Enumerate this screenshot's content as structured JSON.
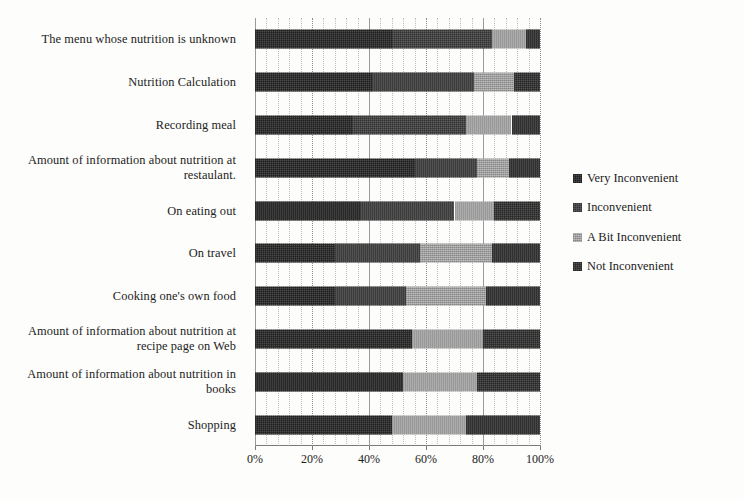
{
  "chart_data": {
    "type": "bar",
    "orientation": "horizontal",
    "stacked": true,
    "normalized": "100%",
    "title": "",
    "xlabel": "",
    "ylabel": "",
    "xlim": [
      0,
      100
    ],
    "xticks": [
      "0%",
      "20%",
      "40%",
      "60%",
      "80%",
      "100%"
    ],
    "xtick_values": [
      0,
      20,
      40,
      60,
      80,
      100
    ],
    "grid": "vertical-dotted",
    "legend_position": "right",
    "categories": [
      "The menu whose nutrition is unknown",
      "Nutrition Calculation",
      "Recording meal",
      "Amount of information about nutrition at restaulant.",
      "On eating out",
      "On travel",
      "Cooking one's own food",
      "Amount of information about nutrition at recipe page on Web",
      "Amount of information about nutrition in books",
      "Shopping"
    ],
    "series": [
      {
        "name": "Very Inconvenient",
        "color": "#4a4a4a",
        "values": [
          48,
          41,
          34,
          56,
          37,
          28,
          28,
          55,
          52,
          48
        ]
      },
      {
        "name": "Inconvenient",
        "color": "#5e5e5e",
        "values": [
          35,
          36,
          40,
          22,
          33,
          30,
          25,
          0,
          0,
          0
        ]
      },
      {
        "name": "A Bit Inconvenient",
        "color": "#9d9d9d",
        "values": [
          12,
          14,
          16,
          11,
          14,
          25,
          28,
          25,
          26,
          26
        ]
      },
      {
        "name": "Not Inconvenient",
        "color": "#525252",
        "values": [
          5,
          9,
          10,
          11,
          16,
          17,
          19,
          20,
          22,
          26
        ]
      }
    ]
  },
  "legend": {
    "items": [
      {
        "label": "Very Inconvenient",
        "swatch": "legend-swatch-very-inconvenient"
      },
      {
        "label": "Inconvenient",
        "swatch": "legend-swatch-inconvenient"
      },
      {
        "label": "A Bit Inconvenient",
        "swatch": "legend-swatch-a-bit-inconvenient"
      },
      {
        "label": "Not Inconvenient",
        "swatch": "legend-swatch-not-inconvenient"
      }
    ]
  }
}
